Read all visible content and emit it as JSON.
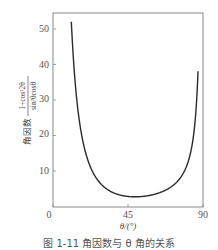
{
  "chart_data": {
    "type": "line",
    "title": "",
    "caption": "图 1-11  角因数与 θ 角的关系",
    "xlabel": "θ/(°)",
    "ylabel": "角因数",
    "ylabel_numerator": "1+cos²2θ",
    "ylabel_denominator": "sin²θcosθ",
    "xlim": [
      0,
      90
    ],
    "ylim": [
      0,
      55
    ],
    "xticks": [
      0,
      45,
      90
    ],
    "yticks": [
      10,
      20,
      30,
      40,
      50
    ],
    "grid": false,
    "legend": null,
    "series": [
      {
        "name": "角因数",
        "x": [
          11,
          12,
          14,
          16,
          18,
          20,
          25,
          30,
          35,
          40,
          45,
          50,
          55,
          60,
          65,
          70,
          75,
          78,
          80,
          82,
          84,
          85,
          86,
          87
        ],
        "values": [
          52.0,
          43.4,
          31.3,
          23.5,
          18.2,
          14.4,
          8.7,
          5.8,
          4.1,
          3.3,
          2.8,
          2.7,
          2.9,
          3.3,
          4.1,
          5.3,
          7.3,
          9.2,
          11.2,
          14.1,
          18.9,
          22.8,
          28.5,
          38.1
        ]
      }
    ]
  },
  "labels": {
    "x_tick_0": "0",
    "x_tick_45": "45",
    "x_tick_90": "90",
    "y_tick_10": "10",
    "y_tick_20": "20",
    "y_tick_30": "30",
    "y_tick_40": "40",
    "y_tick_50": "50"
  }
}
